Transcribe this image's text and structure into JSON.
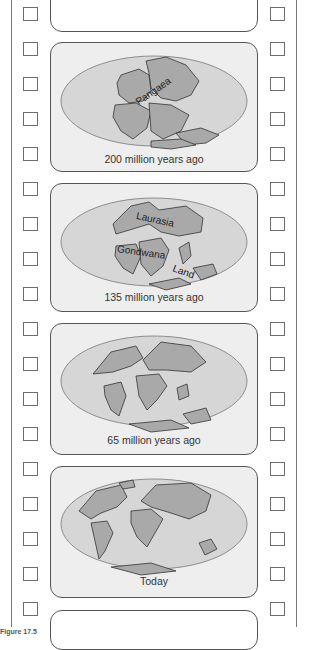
{
  "frames": [
    {
      "caption": "200 million years ago",
      "labels": [
        "Pangaea"
      ]
    },
    {
      "caption": "135 million years ago",
      "labels": [
        "Laurasia",
        "Gondwana",
        "Land"
      ]
    },
    {
      "caption": "65 million years ago",
      "labels": []
    },
    {
      "caption": "Today",
      "labels": []
    }
  ],
  "figure_label": "Figure 17.5",
  "colors": {
    "frame_bg": "#eeeeee",
    "ocean": "#d6d6d6",
    "land": "#a9a9a9",
    "border": "#555555"
  }
}
